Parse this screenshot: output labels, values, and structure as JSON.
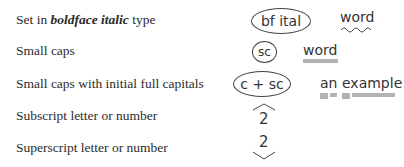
{
  "rows": [
    {
      "label_prefix": "Set in ",
      "label_emphasis": "boldface italic",
      "label_suffix": " type",
      "mark_symbol": "bf ital",
      "example_word": "word",
      "underline": "wavy"
    },
    {
      "label": "Small caps",
      "mark_symbol": "sc",
      "example_word": "word",
      "underline": "double"
    },
    {
      "label": "Small caps with initial full capitals",
      "mark_symbol": "c + sc",
      "example_words": [
        "an",
        "example"
      ],
      "underline": "triple-initial-double-rest"
    },
    {
      "label": "Subscript letter or number",
      "mark_symbol": "2",
      "caret": "above"
    },
    {
      "label": "Superscript letter or number",
      "mark_symbol": "2",
      "caret": "below"
    }
  ],
  "colors": {
    "text": "#2b2b2b",
    "mark": "#333333",
    "background": "#ffffff"
  }
}
